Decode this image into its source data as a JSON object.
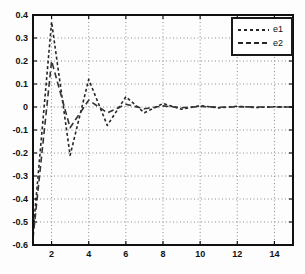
{
  "chart_data": {
    "type": "line",
    "title": "",
    "xlabel": "",
    "ylabel": "",
    "xlim": [
      1,
      15
    ],
    "ylim": [
      -0.6,
      0.4
    ],
    "xticks": [
      2,
      4,
      6,
      8,
      10,
      12,
      14
    ],
    "ytick_values": [
      0.4,
      0.3,
      0.2,
      0.1,
      0,
      -0.1,
      -0.2,
      -0.3,
      -0.4,
      -0.5,
      -0.6
    ],
    "ytick_labels": [
      "0.4",
      "0.3",
      "0.2",
      "0.1",
      "0",
      "-0.1",
      "-0.2",
      "-0.3",
      "-0.4",
      "-0.5",
      "-0.6"
    ],
    "x": [
      1,
      2,
      3,
      4,
      5,
      6,
      7,
      8,
      9,
      10,
      11,
      12,
      13,
      14,
      15
    ],
    "series": [
      {
        "name": "e1",
        "values": [
          -0.55,
          0.37,
          -0.21,
          0.12,
          -0.08,
          0.045,
          -0.025,
          0.015,
          -0.01,
          0.006,
          -0.004,
          0.003,
          -0.002,
          0.001,
          0.0
        ],
        "dash": [
          3,
          2.5
        ],
        "color": "#262626",
        "width": 1.6
      },
      {
        "name": "e2",
        "values": [
          -0.57,
          0.2,
          -0.09,
          0.03,
          -0.025,
          0.012,
          -0.008,
          0.005,
          -0.003,
          0.002,
          -0.001,
          0.001,
          0.0,
          0.0,
          0.0
        ],
        "dash": [
          6,
          3.5
        ],
        "color": "#333333",
        "width": 1.6
      }
    ],
    "grid": "dotted",
    "legend_position": "top-right"
  },
  "colors": {
    "background": "#fdfdfd",
    "plot_background": "#fdfdfd",
    "axis": "#111111",
    "grid": "#8c8c8c",
    "tick_label": "#111111",
    "legend_border": "#1a1a1a",
    "legend_background": "#ffffff"
  }
}
